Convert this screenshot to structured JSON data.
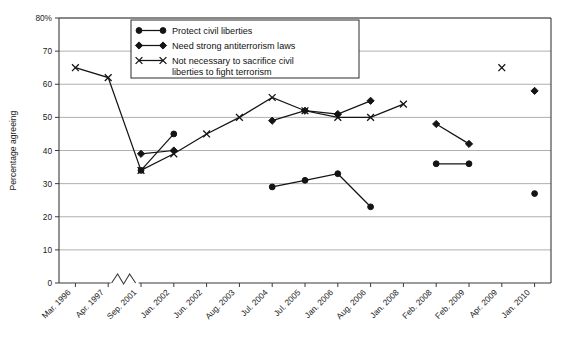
{
  "chart_data": {
    "type": "line",
    "title": "",
    "xlabel": "",
    "ylabel": "Percentage agreeing",
    "ylim": [
      0,
      80
    ],
    "ytick_values": [
      0,
      10,
      20,
      30,
      40,
      50,
      60,
      70,
      80
    ],
    "ytick_labels": [
      "0",
      "10",
      "20",
      "30",
      "40",
      "50",
      "60",
      "70",
      "80%"
    ],
    "grid": true,
    "legend_position": "top-center",
    "axis_break": {
      "between": [
        "Apr. 1997",
        "Sep. 2001"
      ],
      "style": "zigzag"
    },
    "categories": [
      "Mar. 1996",
      "Apr. 1997",
      "Sep. 2001",
      "Jan. 2002",
      "Jun. 2002",
      "Aug. 2003",
      "Jul. 2004",
      "Jul. 2005",
      "Jan. 2006",
      "Aug. 2006",
      "Jan. 2008",
      "Feb. 2008",
      "Feb. 2009",
      "Apr. 2009",
      "Jan. 2010"
    ],
    "series": [
      {
        "name": "Protect civil liberties",
        "marker": "circle",
        "values": [
          null,
          null,
          34,
          45,
          null,
          null,
          29,
          31,
          33,
          23,
          null,
          36,
          36,
          null,
          27
        ]
      },
      {
        "name": "Need strong antiterrorism laws",
        "marker": "diamond",
        "values": [
          null,
          null,
          39,
          40,
          null,
          null,
          49,
          52,
          51,
          55,
          null,
          48,
          42,
          null,
          58
        ]
      },
      {
        "name": "Not necessary to sacrifice civil liberties to fight terrorism",
        "marker": "x",
        "values": [
          65,
          62,
          34,
          39,
          45,
          50,
          56,
          52,
          50,
          50,
          54,
          null,
          null,
          65,
          null
        ]
      }
    ]
  },
  "legend": {
    "entries": [
      {
        "label": "Protect civil liberties",
        "marker": "circle"
      },
      {
        "label": "Need strong antiterrorism laws",
        "marker": "diamond"
      },
      {
        "label": "Not necessary to sacrifice civil",
        "marker": "x"
      },
      {
        "label": "liberties to fight terrorism",
        "marker": "none"
      }
    ]
  }
}
